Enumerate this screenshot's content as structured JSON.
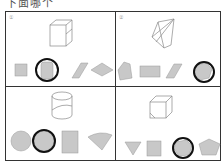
{
  "header": {
    "text": "下面哪个"
  },
  "panels": [
    {
      "tag": "①",
      "solid": "cuboid",
      "options": [
        "square",
        "rounded-rectangle",
        "parallelogram",
        "rhombus"
      ],
      "circled_index": 1
    },
    {
      "tag": "②",
      "solid": "cut-cube",
      "options": [
        "pentagon",
        "rectangle",
        "parallelogram",
        "hexagon"
      ],
      "circled_index": 3
    },
    {
      "tag": "",
      "solid": "cylinder",
      "options": [
        "circle",
        "circle",
        "rectangle",
        "sector"
      ],
      "circled_index": 1
    },
    {
      "tag": "",
      "solid": "cube-with-cut-corner",
      "options": [
        "triangle",
        "square",
        "hexagon",
        "pentagon"
      ],
      "circled_index": 2
    }
  ],
  "colors": {
    "shape_fill": "#c8c8c8",
    "line": "#333333",
    "circle_mark": "#111111"
  }
}
